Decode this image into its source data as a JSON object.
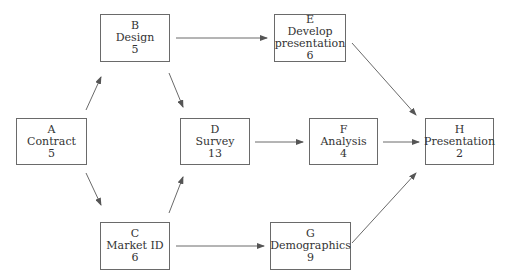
{
  "diagram": {
    "type": "activity-on-node network",
    "line_color": "#6a6a6a",
    "text_color": "#333333",
    "nodes": [
      {
        "id": "A",
        "name": "Contract",
        "duration": "5",
        "box": [
          16,
          118,
          71,
          47
        ]
      },
      {
        "id": "B",
        "name": "Design",
        "duration": "5",
        "box": [
          100,
          14,
          70,
          48
        ]
      },
      {
        "id": "C",
        "name": "Market ID",
        "duration": "6",
        "box": [
          100,
          222,
          70,
          48
        ]
      },
      {
        "id": "D",
        "name": "Survey",
        "duration": "13",
        "box": [
          180,
          118,
          70,
          47
        ]
      },
      {
        "id": "E",
        "name": "Develop presentation",
        "name_lines": [
          "Develop",
          "presentation"
        ],
        "duration": "6",
        "box": [
          274,
          14,
          72,
          48
        ]
      },
      {
        "id": "F",
        "name": "Analysis",
        "duration": "4",
        "box": [
          309,
          118,
          69,
          47
        ]
      },
      {
        "id": "G",
        "name": "Demographics",
        "duration": "9",
        "box": [
          270,
          222,
          81,
          48
        ]
      },
      {
        "id": "H",
        "name": "Presentation",
        "duration": "2",
        "box": [
          425,
          118,
          69,
          47
        ]
      }
    ],
    "edges": [
      {
        "from": "A",
        "to": "B",
        "points": [
          86,
          110,
          101,
          77
        ]
      },
      {
        "from": "A",
        "to": "C",
        "points": [
          86,
          173,
          101,
          205
        ]
      },
      {
        "from": "B",
        "to": "D",
        "points": [
          169,
          73,
          183,
          107
        ]
      },
      {
        "from": "B",
        "to": "E",
        "points": [
          176,
          38,
          267,
          38
        ]
      },
      {
        "from": "C",
        "to": "D",
        "points": [
          169,
          213,
          183,
          177
        ]
      },
      {
        "from": "C",
        "to": "G",
        "points": [
          176,
          246,
          264,
          246
        ]
      },
      {
        "from": "D",
        "to": "F",
        "points": [
          255,
          142,
          303,
          142
        ]
      },
      {
        "from": "E",
        "to": "H",
        "points": [
          352,
          43,
          416,
          115
        ]
      },
      {
        "from": "F",
        "to": "H",
        "points": [
          383,
          142,
          419,
          142
        ]
      },
      {
        "from": "G",
        "to": "H",
        "points": [
          352,
          243,
          416,
          173
        ]
      }
    ]
  }
}
